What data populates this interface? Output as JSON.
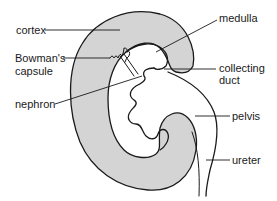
{
  "diagram": {
    "labels": {
      "cortex": "cortex",
      "bowmans_line1": "Bowman's",
      "bowmans_line2": "capsule",
      "nephron": "nephron",
      "medulla": "medulla",
      "collecting_line1": "collecting",
      "collecting_line2": "duct",
      "pelvis": "pelvis",
      "ureter": "ureter"
    },
    "colors": {
      "cortex_fill": "#d4d4d4",
      "outline": "#1a1a1a",
      "background": "#ffffff"
    }
  }
}
